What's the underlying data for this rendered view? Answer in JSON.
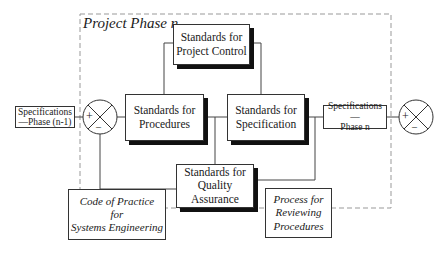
{
  "diagram": {
    "boundary_title": "Project Phase n",
    "boxes": {
      "project_control": [
        "Standards for",
        "Project Control"
      ],
      "procedures": [
        "Standards for",
        "Procedures"
      ],
      "specification": [
        "Standards for",
        "Specification"
      ],
      "quality_assurance": [
        "Standards for",
        "Quality",
        "Assurance"
      ],
      "spec_prev": [
        "Specifications",
        "—Phase (n-1)"
      ],
      "spec_curr": [
        "Specifications—",
        "Phase n"
      ],
      "code_of_practice": [
        "Code of Practice",
        "for",
        "Systems Engineering"
      ],
      "process_reviewing": [
        "Process for",
        "Reviewing",
        "Procedures"
      ]
    },
    "junctions": {
      "left": {
        "plus": "+",
        "minus": "–"
      },
      "right": {
        "plus": "+",
        "minus": "–"
      }
    },
    "colors": {
      "line": "#333333",
      "shadow": "#111111",
      "dashed": "#999999"
    }
  }
}
